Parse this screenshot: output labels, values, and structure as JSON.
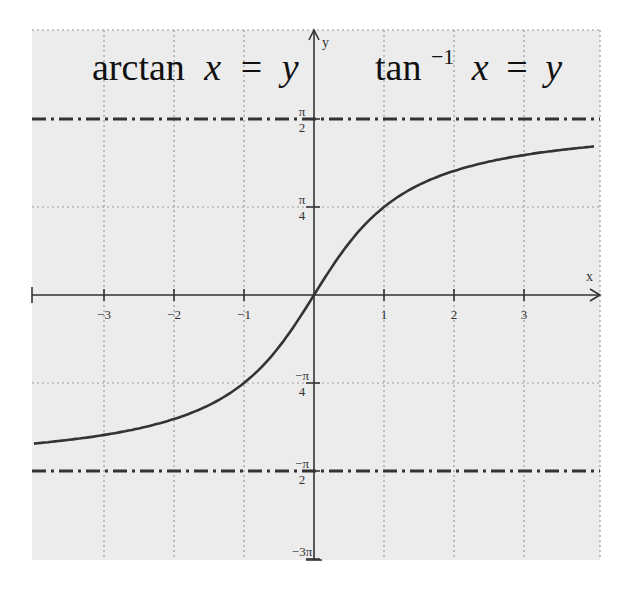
{
  "chart_data": {
    "type": "line",
    "title_left": {
      "fn": "arctan",
      "var": "x",
      "eq": "=",
      "res": "y"
    },
    "title_right": {
      "fn": "tan",
      "sup": "−1",
      "var": "x",
      "eq": "=",
      "res": "y"
    },
    "xlabel": "x",
    "ylabel": "y",
    "xlim": [
      -4.0,
      4.0
    ],
    "ylim": [
      -2.356,
      2.5
    ],
    "grid": true,
    "x_ticks": [
      {
        "value": -3,
        "label": "−3"
      },
      {
        "value": -2,
        "label": "−2"
      },
      {
        "value": -1,
        "label": "−1"
      },
      {
        "value": 1,
        "label": "1"
      },
      {
        "value": 2,
        "label": "2"
      },
      {
        "value": 3,
        "label": "3"
      }
    ],
    "y_ticks": [
      {
        "value": 1.5708,
        "num": "π",
        "den": "2"
      },
      {
        "value": 0.7854,
        "num": "π",
        "den": "4"
      },
      {
        "value": -0.7854,
        "num": "−π",
        "den": "4"
      },
      {
        "value": -1.5708,
        "num": "−π",
        "den": "2"
      },
      {
        "value": -2.3562,
        "num": "−3π",
        "den": ""
      }
    ],
    "asymptotes": [
      {
        "y": 1.5708,
        "label": "y = π/2",
        "style": "dash-dot"
      },
      {
        "y": -1.5708,
        "label": "y = −π/2",
        "style": "dash-dot"
      }
    ],
    "series": [
      {
        "name": "y = arctan x",
        "x": [
          -4.0,
          -3.5,
          -3.0,
          -2.5,
          -2.0,
          -1.5,
          -1.0,
          -0.75,
          -0.5,
          -0.25,
          0.0,
          0.25,
          0.5,
          0.75,
          1.0,
          1.5,
          2.0,
          2.5,
          3.0,
          3.5,
          4.0
        ],
        "y": [
          -1.3258,
          -1.2925,
          -1.249,
          -1.1903,
          -1.1071,
          -0.9828,
          -0.7854,
          -0.6435,
          -0.4636,
          -0.245,
          0.0,
          0.245,
          0.4636,
          0.6435,
          0.7854,
          0.9828,
          1.1071,
          1.1903,
          1.249,
          1.2925,
          1.3258
        ]
      }
    ]
  }
}
